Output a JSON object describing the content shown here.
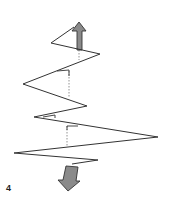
{
  "figure": {
    "label": "4",
    "colors": {
      "line": "#333333",
      "arrow_fill": "#8a8a8a",
      "arrow_stroke": "#333333",
      "dotted": "#777777",
      "background": "#ffffff"
    },
    "zigzag_points": [
      [
        72,
        26
      ],
      [
        51,
        43
      ],
      [
        100,
        54
      ],
      [
        23,
        84
      ],
      [
        87,
        106
      ],
      [
        34,
        117
      ],
      [
        158,
        137
      ],
      [
        14,
        153
      ],
      [
        98,
        160
      ],
      [
        72,
        164
      ]
    ],
    "dotted_guides": [
      [
        [
          79,
          50
        ],
        [
          79,
          60
        ]
      ],
      [
        [
          69,
          70
        ],
        [
          69,
          98
        ]
      ],
      [
        [
          67,
          126
        ],
        [
          67,
          147
        ]
      ]
    ],
    "corner_marks": [
      [
        [
          57,
          71
        ],
        [
          69,
          70
        ]
      ],
      [
        [
          43,
          117
        ],
        [
          55,
          115
        ]
      ],
      [
        [
          67,
          126
        ],
        [
          78,
          126
        ]
      ]
    ],
    "arrows": [
      {
        "name": "up-arrow",
        "direction": "up",
        "shaft_bottom": [
          80,
          50
        ],
        "tip": [
          79,
          22
        ]
      },
      {
        "name": "down-arrow",
        "direction": "down",
        "shaft_top": [
          72,
          165
        ],
        "tip": [
          68,
          191
        ]
      }
    ]
  }
}
